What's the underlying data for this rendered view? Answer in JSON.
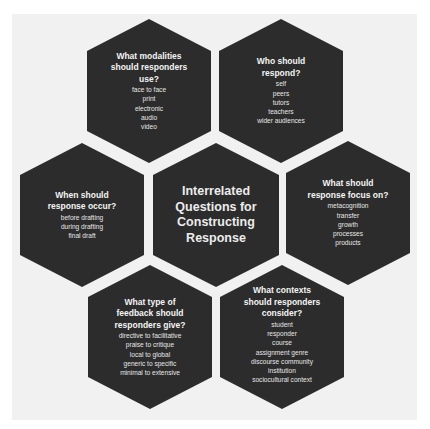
{
  "diagram": {
    "center": {
      "title_lines": [
        "Interrelated",
        "Questions for",
        "Constructing",
        "Response"
      ]
    },
    "hexagons": [
      {
        "id": "modalities",
        "question_lines": [
          "What modalities",
          "should responders",
          "use?"
        ],
        "items": [
          "face to face",
          "print",
          "electronic",
          "audio",
          "video"
        ]
      },
      {
        "id": "who",
        "question_lines": [
          "Who should",
          "respond?"
        ],
        "items": [
          "self",
          "peers",
          "tutors",
          "teachers",
          "wider audiences"
        ]
      },
      {
        "id": "when",
        "question_lines": [
          "When should",
          "response occur?"
        ],
        "items": [
          "before drafting",
          "during drafting",
          "final draft"
        ]
      },
      {
        "id": "focus",
        "question_lines": [
          "What should",
          "response focus on?"
        ],
        "items": [
          "metacognition",
          "transfer",
          "growth",
          "processes",
          "products"
        ]
      },
      {
        "id": "feedback-type",
        "question_lines": [
          "What type of",
          "feedback should",
          "responders give?"
        ],
        "items": [
          "directive to facilitative",
          "praise to critique",
          "local to global",
          "generic to specific",
          "minimal to extensive"
        ]
      },
      {
        "id": "contexts",
        "question_lines": [
          "What contexts",
          "should responders",
          "consider?"
        ],
        "items": [
          "student",
          "responder",
          "course",
          "assignment genre",
          "discourse community",
          "institution",
          "sociocultural context"
        ]
      }
    ],
    "colors": {
      "hexagon_fill": "#2c2c2c",
      "panel_background": "#f1f1f1",
      "text": "#f4f4f4"
    }
  }
}
